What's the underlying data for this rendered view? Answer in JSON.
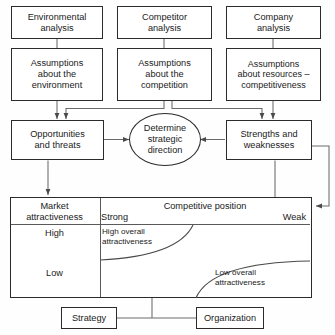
{
  "diagram": {
    "type": "flow-diagram",
    "row_analysis": [
      {
        "id": "environmental-analysis",
        "line1": "Environmental",
        "line2": "analysis"
      },
      {
        "id": "competitor-analysis",
        "line1": "Competitor",
        "line2": "analysis"
      },
      {
        "id": "company-analysis",
        "line1": "Company",
        "line2": "analysis"
      }
    ],
    "row_assumptions": [
      {
        "id": "assumptions-environment",
        "line1": "Assumptions",
        "line2": "about the",
        "line3": "environment"
      },
      {
        "id": "assumptions-competition",
        "line1": "Assumptions",
        "line2": "about the",
        "line3": "competition"
      },
      {
        "id": "assumptions-resources",
        "line1": "Assumptions",
        "line2": "about resources –",
        "line3": "competitiveness"
      }
    ],
    "row_swot": {
      "left": {
        "id": "opportunities-and-threats",
        "line1": "Opportunities",
        "line2": "and threats"
      },
      "center": {
        "id": "determine-strategic-direction",
        "line1": "Determine",
        "line2": "strategic",
        "line3": "direction"
      },
      "right": {
        "id": "strengths-and-weaknesses",
        "line1": "Strengths and",
        "line2": "weaknesses"
      }
    },
    "matrix": {
      "row_header": "Market attractiveness",
      "row_header_line1": "Market",
      "row_header_line2": "attractiveness",
      "col_header": "Competitive position",
      "columns": [
        "Strong",
        "Weak"
      ],
      "rows": [
        "High",
        "Low"
      ],
      "zones": [
        {
          "id": "high-overall-attractiveness",
          "line1": "High overall",
          "line2": "attractiveness"
        },
        {
          "id": "low-overall-attractiveness",
          "line1": "Low overall",
          "line2": "attractiveness"
        }
      ]
    },
    "row_outcome": [
      {
        "id": "strategy",
        "label": "Strategy"
      },
      {
        "id": "organization",
        "label": "Organization"
      }
    ],
    "colors": {
      "stroke": "#2b2b2b",
      "connector": "#6a6a6a",
      "grid": "#5a5a5a",
      "background": "#fefefe",
      "text": "#1a1a1a"
    }
  }
}
